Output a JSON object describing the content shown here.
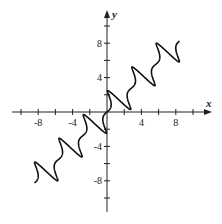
{
  "chart_data": {
    "type": "line",
    "title": "",
    "xlabel": "x",
    "ylabel": "y",
    "xlim": [
      -10,
      12
    ],
    "ylim": [
      -12,
      12
    ],
    "grid": false,
    "x_tick_labels": [
      "-8",
      "-4",
      "4",
      "8"
    ],
    "y_tick_labels": [
      "8",
      "4",
      "-4",
      "-8"
    ],
    "x_ticks": [
      -10,
      -8,
      -6,
      -4,
      -2,
      2,
      4,
      6,
      8,
      10
    ],
    "y_ticks": [
      10,
      8,
      6,
      4,
      2,
      -2,
      -4,
      -6,
      -8,
      -10
    ],
    "series": [
      {
        "name": "parametric curve",
        "description": "Curve running along y = x with figure-eight loops at regular intervals",
        "loop_crossings": [
          [
            -7.8,
            -7.8
          ],
          [
            -4.6,
            -4.6
          ],
          [
            -1.4,
            -1.4
          ],
          [
            1.4,
            1.2
          ],
          [
            4.6,
            4.4
          ],
          [
            7.8,
            7.4
          ]
        ],
        "t_range": [
          -9.4,
          9.4
        ],
        "color": "#111111"
      }
    ]
  },
  "axes": {
    "x_label": "x",
    "y_label": "y",
    "x_tick_labels": [
      {
        "value": -8,
        "label": "-8"
      },
      {
        "value": -4,
        "label": "-4"
      },
      {
        "value": 4,
        "label": "4"
      },
      {
        "value": 8,
        "label": "8"
      }
    ],
    "y_tick_labels": [
      {
        "value": 8,
        "label": "8"
      },
      {
        "value": 4,
        "label": "4"
      },
      {
        "value": -4,
        "label": "-4"
      },
      {
        "value": -8,
        "label": "-8"
      }
    ]
  },
  "colors": {
    "axis": "#222222",
    "curve": "#111111"
  }
}
